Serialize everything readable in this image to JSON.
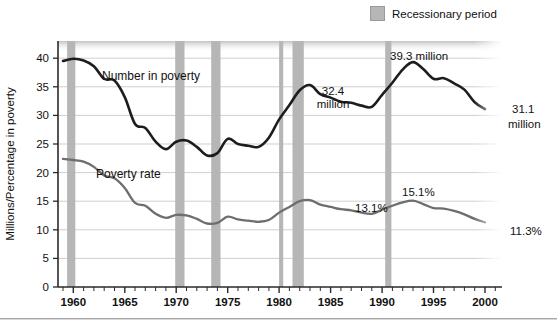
{
  "legend": {
    "swatch_name": "recession-swatch",
    "label": "Recessionary period",
    "color": "#b6b6b6"
  },
  "axis": {
    "y_title": "Millions/Percentage in poverty",
    "y_ticks": [
      "0",
      "5",
      "10",
      "15",
      "20",
      "25",
      "30",
      "35",
      "40"
    ],
    "x_ticks": [
      "1960",
      "1965",
      "1970",
      "1975",
      "1980",
      "1985",
      "1990",
      "1995",
      "2000"
    ]
  },
  "series_labels": {
    "number": "Number in poverty",
    "rate": "Poverty rate"
  },
  "annotations": {
    "a324": "32.4\nmillion",
    "a324_line1": "32.4",
    "a324_line2": "million",
    "a393": "39.3 million",
    "a311_line1": "31.1",
    "a311_line2": "million",
    "a131": "13.1%",
    "a151": "15.1%",
    "a113": "11.3%"
  },
  "colors": {
    "number_line": "#1d1d1d",
    "rate_line": "#6e6e6e",
    "recession_band": "#b6b6b6",
    "gridline": "#c9c9c9",
    "axis": "#2a2a2a",
    "plot_bg": "#ffffff"
  },
  "chart_data": {
    "type": "line",
    "title": "",
    "xlabel": "",
    "ylabel": "Millions/Percentage in poverty",
    "xlim": [
      1959,
      2000
    ],
    "ylim": [
      0,
      43
    ],
    "grid": true,
    "legend_position": "top-right",
    "x": [
      1959,
      1960,
      1961,
      1962,
      1963,
      1964,
      1965,
      1966,
      1967,
      1968,
      1969,
      1970,
      1971,
      1972,
      1973,
      1974,
      1975,
      1976,
      1977,
      1978,
      1979,
      1980,
      1981,
      1982,
      1983,
      1984,
      1985,
      1986,
      1987,
      1988,
      1989,
      1990,
      1991,
      1992,
      1993,
      1994,
      1995,
      1996,
      1997,
      1998,
      1999,
      2000
    ],
    "series": [
      {
        "name": "Number in poverty",
        "unit": "millions",
        "color": "#1d1d1d",
        "values": [
          39.5,
          39.9,
          39.6,
          38.6,
          36.4,
          36.1,
          33.2,
          28.5,
          27.8,
          25.4,
          24.1,
          25.4,
          25.6,
          24.5,
          23.0,
          23.4,
          25.9,
          25.0,
          24.7,
          24.5,
          26.1,
          29.3,
          31.8,
          34.4,
          35.3,
          33.7,
          33.1,
          32.4,
          32.2,
          31.7,
          31.5,
          33.6,
          35.7,
          38.0,
          39.3,
          38.1,
          36.4,
          36.5,
          35.6,
          34.5,
          32.3,
          31.1
        ]
      },
      {
        "name": "Poverty rate",
        "unit": "percent",
        "color": "#6e6e6e",
        "values": [
          22.4,
          22.2,
          21.9,
          21.0,
          19.5,
          19.0,
          17.3,
          14.7,
          14.2,
          12.8,
          12.1,
          12.6,
          12.5,
          11.9,
          11.1,
          11.2,
          12.3,
          11.8,
          11.6,
          11.4,
          11.7,
          13.0,
          14.0,
          15.0,
          15.2,
          14.4,
          14.0,
          13.6,
          13.4,
          13.0,
          12.8,
          13.5,
          14.2,
          14.8,
          15.1,
          14.5,
          13.8,
          13.7,
          13.3,
          12.7,
          11.9,
          11.3
        ]
      }
    ],
    "recessions": [
      {
        "start": 1959.4,
        "end": 1960.2
      },
      {
        "start": 1969.9,
        "end": 1970.8
      },
      {
        "start": 1973.4,
        "end": 1974.3
      },
      {
        "start": 1980.0,
        "end": 1980.4
      },
      {
        "start": 1981.3,
        "end": 1982.4
      },
      {
        "start": 1990.3,
        "end": 1990.9
      }
    ],
    "callouts": [
      {
        "label": "32.4 million",
        "year": 1987,
        "value": 32.4,
        "series": "Number in poverty"
      },
      {
        "label": "39.3 million",
        "year": 1993,
        "value": 39.3,
        "series": "Number in poverty"
      },
      {
        "label": "31.1 million",
        "year": 2000,
        "value": 31.1,
        "series": "Number in poverty"
      },
      {
        "label": "13.1%",
        "year": 1988,
        "value": 13.0,
        "series": "Poverty rate"
      },
      {
        "label": "15.1%",
        "year": 1993,
        "value": 15.1,
        "series": "Poverty rate"
      },
      {
        "label": "11.3%",
        "year": 2000,
        "value": 11.3,
        "series": "Poverty rate"
      }
    ]
  }
}
